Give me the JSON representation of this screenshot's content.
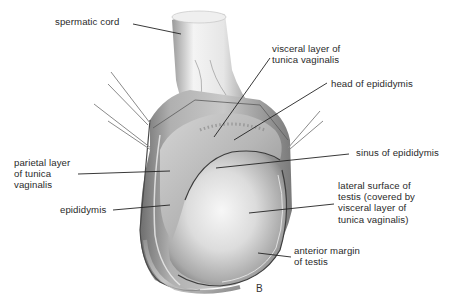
{
  "figure": {
    "panel_letter": "B"
  },
  "labels": {
    "spermatic_cord": "spermatic cord",
    "visceral_layer": "visceral layer of\ntunica vaginalis",
    "head_epididymis": "head of epididymis",
    "sinus_epididymis": "sinus of epididymis",
    "parietal_layer": "parietal layer\nof tunica\nvaginalis",
    "epididymis": "epididymis",
    "lateral_surface": "lateral surface of\ntestis (covered by\nvisceral layer of\ntunica vaginalis)",
    "anterior_margin": "anterior margin\nof testis"
  },
  "colors": {
    "background": "#ffffff",
    "text": "#2a2a2a",
    "leader_line": "#222222",
    "tissue_light": "#f2f2f2",
    "tissue_mid": "#b8b8b8",
    "tissue_dark": "#555555",
    "pin": "#8a8a8a"
  }
}
